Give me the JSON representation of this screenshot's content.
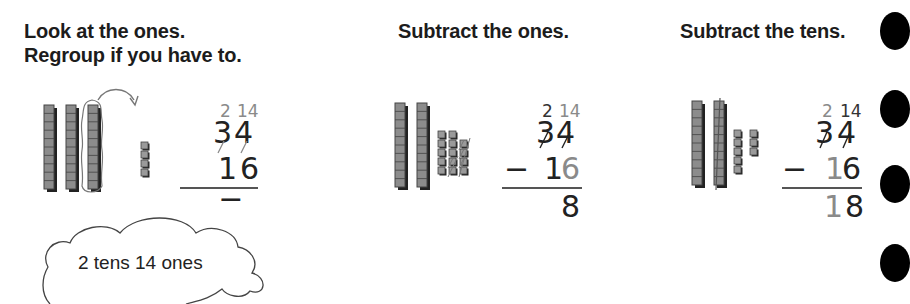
{
  "steps": [
    {
      "heading_line1": "Look at the ones.",
      "heading_line2": "Regroup if you have to.",
      "regroup_tens": "2",
      "regroup_ones": "14",
      "top_tens": "3",
      "top_ones": "4",
      "minus": "−",
      "bottom_tens": "1",
      "bottom_ones": "6",
      "answer": "",
      "blocks": {
        "tens_rods": 3,
        "ones_cubes": 4,
        "circled_rod": true
      },
      "cloud_label": "2 tens 14 ones"
    },
    {
      "heading": "Subtract the ones.",
      "regroup_tens": "2",
      "regroup_ones": "14",
      "top_tens": "3",
      "top_ones": "4",
      "minus": "−",
      "bottom_tens": "1",
      "bottom_ones": "6",
      "answer": "8",
      "blocks": {
        "tens_rods": 2,
        "ones_cubes": 14,
        "crossed_out_cubes": 6
      }
    },
    {
      "heading": "Subtract the tens.",
      "regroup_tens": "2",
      "regroup_ones": "14",
      "top_tens": "3",
      "top_ones": "4",
      "minus": "−",
      "bottom_tens": "1",
      "bottom_ones": "6",
      "answer": "18",
      "blocks": {
        "tens_rods": 2,
        "crossed_out_rods": 1,
        "ones_cubes": 8
      }
    }
  ],
  "side_tabs_count": 4
}
